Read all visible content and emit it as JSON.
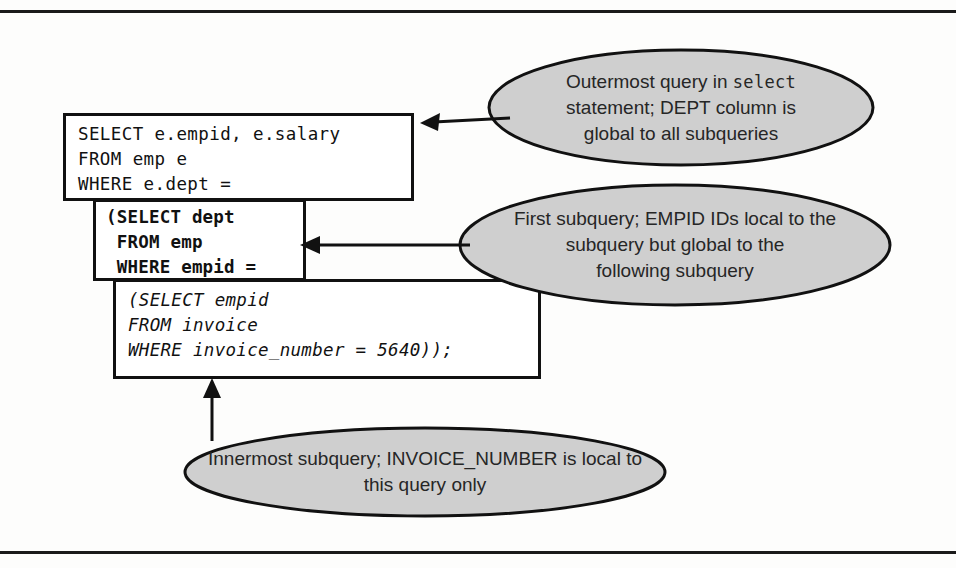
{
  "figure": {
    "background": "#fdfdfc",
    "rule_color": "#1a1a1a",
    "ellipse_fill": "#cfcfcf",
    "ellipse_stroke": "#111111",
    "box_stroke": "#111111",
    "text_color": "#262626"
  },
  "code": {
    "outer_query": "SELECT e.empid, e.salary\nFROM emp e\nWHERE e.dept =",
    "first_subquery": "(SELECT dept\n FROM emp\n WHERE empid =",
    "inner_subquery": "(SELECT empid\nFROM invoice\nWHERE invoice_number = 5640));"
  },
  "callouts": {
    "outermost": {
      "line1_a": "Outermost query in ",
      "line1_mono": "select",
      "line2": "statement; DEPT column is",
      "line3": "global to all subqueries"
    },
    "first": {
      "line1": "First subquery; EMPID IDs local to the",
      "line2": "subquery but global to the",
      "line3": "following subquery"
    },
    "innermost": {
      "line1": "Innermost subquery; INVOICE_NUMBER is local to",
      "line2": "this query only"
    }
  },
  "connectors": {
    "outermost_arrow": "arrow-left-to-outer-query-box",
    "first_arrow": "arrow-left-to-first-subquery-box",
    "innermost_arrow": "arrow-up-to-inner-subquery-box"
  }
}
